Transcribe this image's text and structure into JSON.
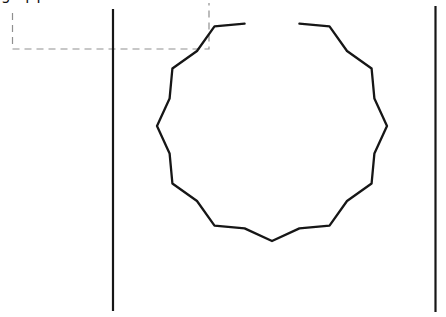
{
  "canvas": {
    "width": 446,
    "height": 317,
    "background": "#ffffff",
    "ink_color": "#161616"
  },
  "label": {
    "text": "gripper",
    "visibility": "clipped-at-top-edge-only-descenders-visible",
    "color": "#111111"
  },
  "selection_box": {
    "style": "dashed",
    "color": "#8f8f8f",
    "dash_pattern": [
      7,
      5
    ],
    "stroke_width": 1.2,
    "left_x": 12.5,
    "right_x": 209,
    "bottom_y": 49,
    "left_edge_top_y": 13,
    "right_edge_top_y": 3
  },
  "walls": {
    "color": "#161616",
    "stroke_width": 2.2,
    "left": {
      "x": 113,
      "y1": 9,
      "y2": 311
    },
    "right": {
      "x": 435.5,
      "y1": 6,
      "y2": 312
    }
  },
  "gear": {
    "description": "open 12-tooth wavy circle (gear outline) with gap at top",
    "cx": 272,
    "cy": 126,
    "r_outer": 115,
    "r_inner": 106,
    "teeth": 12,
    "step_deg": 15,
    "start_deg": -75,
    "end_deg": 255,
    "stroke": "#161616",
    "stroke_width": 2.3
  }
}
